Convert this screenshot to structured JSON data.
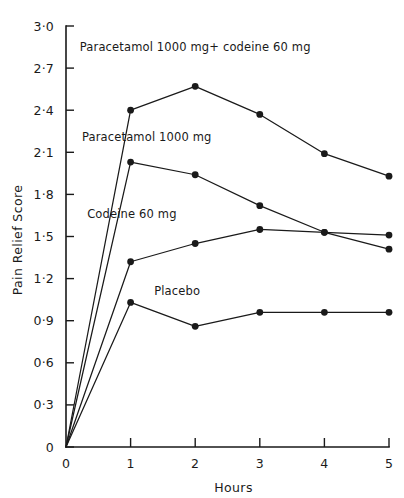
{
  "chart_data": {
    "type": "line",
    "title": "",
    "xlabel": "Hours",
    "ylabel": "Pain Relief Score",
    "x": [
      0,
      1,
      2,
      3,
      4,
      5
    ],
    "xlim": [
      0,
      5
    ],
    "ylim": [
      0,
      3.0
    ],
    "grid": false,
    "legend_position": "inline-annotations",
    "x_tick_labels": [
      "0",
      "1",
      "2",
      "3",
      "4",
      "5"
    ],
    "y_tick_labels": [
      "0",
      "0·3",
      "0·6",
      "0·9",
      "1·2",
      "1·5",
      "1·8",
      "2·1",
      "2·4",
      "2·7",
      "3·0"
    ],
    "y_tick_values": [
      0,
      0.3,
      0.6,
      0.9,
      1.2,
      1.5,
      1.8,
      2.1,
      2.4,
      2.7,
      3.0
    ],
    "origin_label": "0",
    "line_color": "#1a1a1a",
    "marker_color": "#1a1a1a",
    "background_color": "#ffffff",
    "series": [
      {
        "name": "Paracetamol 1000 mg + codeine 60 mg",
        "label": "Paracetamol 1000 mg+ codeine 60 mg",
        "label_x": 2.0,
        "label_y": 2.82,
        "values": [
          0,
          2.4,
          2.57,
          2.37,
          2.09,
          1.93
        ]
      },
      {
        "name": "Paracetamol 1000 mg",
        "label": "Paracetamol 1000 mg",
        "label_x": 1.25,
        "label_y": 2.18,
        "values": [
          0,
          2.03,
          1.94,
          1.72,
          1.53,
          1.41
        ]
      },
      {
        "name": "Codeine 60 mg",
        "label": "Codeine 60 mg",
        "label_x": 1.02,
        "label_y": 1.63,
        "values": [
          0,
          1.32,
          1.45,
          1.55,
          1.53,
          1.51
        ]
      },
      {
        "name": "Placebo",
        "label": "Placebo",
        "label_x": 1.72,
        "label_y": 1.08,
        "values": [
          0,
          1.03,
          0.86,
          0.96,
          0.96,
          0.96
        ]
      }
    ]
  }
}
